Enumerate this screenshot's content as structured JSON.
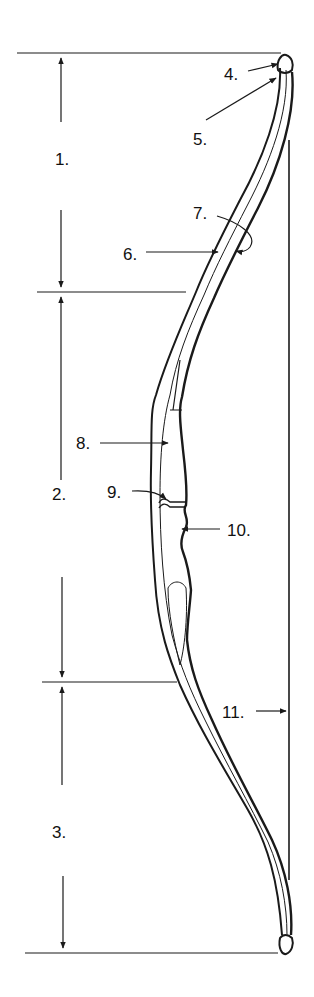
{
  "diagram": {
    "colors": {
      "ink": "#1a1a1a",
      "background": "#ffffff"
    },
    "labels": [
      {
        "id": "1",
        "text": "1.",
        "x": 55,
        "y": 165
      },
      {
        "id": "2",
        "text": "2.",
        "x": 52,
        "y": 500
      },
      {
        "id": "3",
        "text": "3.",
        "x": 52,
        "y": 838
      },
      {
        "id": "4",
        "text": "4.",
        "x": 224,
        "y": 80
      },
      {
        "id": "5",
        "text": "5.",
        "x": 193,
        "y": 145
      },
      {
        "id": "6",
        "text": "6.",
        "x": 123,
        "y": 260
      },
      {
        "id": "7",
        "text": "7.",
        "x": 193,
        "y": 219
      },
      {
        "id": "8",
        "text": "8.",
        "x": 76,
        "y": 449
      },
      {
        "id": "9",
        "text": "9.",
        "x": 107,
        "y": 498
      },
      {
        "id": "10",
        "text": "10.",
        "x": 227,
        "y": 536
      },
      {
        "id": "11",
        "text": "11.",
        "x": 222,
        "y": 718
      }
    ]
  }
}
